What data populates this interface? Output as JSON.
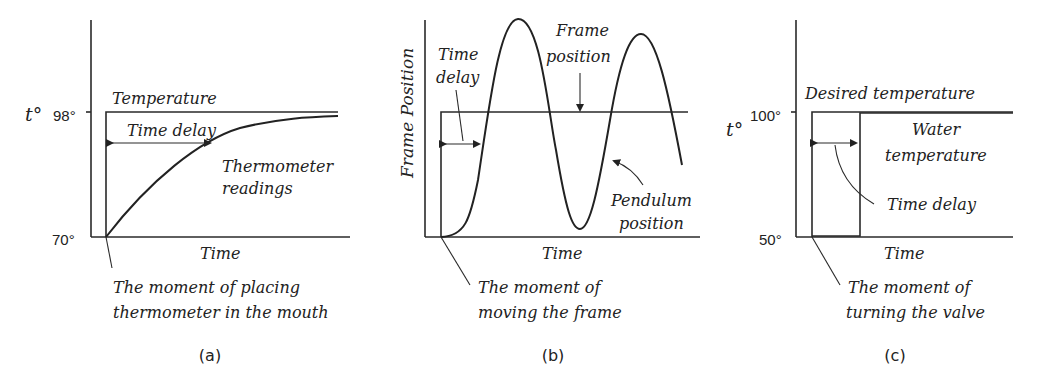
{
  "figure": {
    "panels": [
      {
        "id": "a",
        "caption": "(a)",
        "y_axis_label": "t°",
        "y_ticks": [
          "98°",
          "70°"
        ],
        "x_axis_label": "Time",
        "annotations": {
          "step_label": "Temperature",
          "delay_label": "Time delay",
          "curve_label_line1": "Thermometer",
          "curve_label_line2": "readings",
          "moment_line1": "The moment of placing",
          "moment_line2": "thermometer in the mouth"
        }
      },
      {
        "id": "b",
        "caption": "(b)",
        "y_axis_label": "Frame Position",
        "x_axis_label": "Time",
        "annotations": {
          "delay_line1": "Time",
          "delay_line2": "delay",
          "frame_line1": "Frame",
          "frame_line2": "position",
          "pendulum_line1": "Pendulum",
          "pendulum_line2": "position",
          "moment_line1": "The moment of",
          "moment_line2": "moving the frame"
        }
      },
      {
        "id": "c",
        "caption": "(c)",
        "y_axis_label": "t°",
        "y_ticks": [
          "100°",
          "50°"
        ],
        "x_axis_label": "Time",
        "annotations": {
          "step_label": "Desired temperature",
          "water_line1": "Water",
          "water_line2": "temperature",
          "delay_label": "Time delay",
          "moment_line1": "The moment of",
          "moment_line2": "turning the valve"
        }
      }
    ]
  }
}
